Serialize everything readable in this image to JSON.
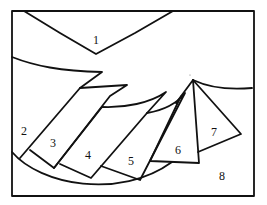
{
  "diagram": {
    "stroke_color": "#111111",
    "background": "#ffffff",
    "regions": [
      {
        "id": "1",
        "label": "1",
        "x": 96,
        "y": 40
      },
      {
        "id": "2",
        "label": "2",
        "x": 24,
        "y": 131
      },
      {
        "id": "3",
        "label": "3",
        "x": 53,
        "y": 143
      },
      {
        "id": "4",
        "label": "4",
        "x": 88,
        "y": 155
      },
      {
        "id": "5",
        "label": "5",
        "x": 131,
        "y": 161
      },
      {
        "id": "6",
        "label": "6",
        "x": 178,
        "y": 150
      },
      {
        "id": "7",
        "label": "7",
        "x": 214,
        "y": 132
      },
      {
        "id": "8",
        "label": "8",
        "x": 222,
        "y": 176
      }
    ]
  }
}
